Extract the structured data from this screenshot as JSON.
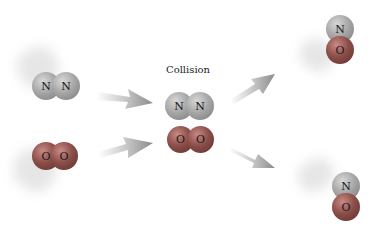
{
  "diagram": {
    "label": "Collision",
    "reactants": [
      {
        "name": "N2",
        "atoms": [
          "N",
          "N"
        ]
      },
      {
        "name": "O2",
        "atoms": [
          "O",
          "O"
        ]
      }
    ],
    "collision_complex": {
      "top": [
        "N",
        "N"
      ],
      "bottom": [
        "O",
        "O"
      ]
    },
    "products": [
      {
        "name": "NO",
        "atoms": [
          "N",
          "O"
        ]
      },
      {
        "name": "NO",
        "atoms": [
          "N",
          "O"
        ]
      }
    ],
    "colors": {
      "nitrogen": "#a0a0a0",
      "oxygen": "#8c4f4a",
      "arrow": "#9a9a9a"
    }
  }
}
